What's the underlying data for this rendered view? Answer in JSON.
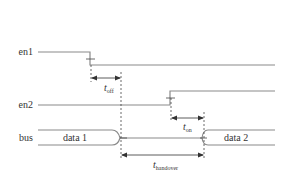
{
  "diagram": {
    "type": "timing-diagram",
    "colors": {
      "line": "#8a8a8a",
      "dim": "#333333",
      "text": "#333333",
      "background": "#ffffff"
    },
    "signals": [
      {
        "id": "en1",
        "label": "en1",
        "initial": "high",
        "transition": "falling",
        "transition_at": "t1"
      },
      {
        "id": "en2",
        "label": "en2",
        "initial": "low",
        "transition": "rising",
        "transition_at": "t2"
      },
      {
        "id": "bus",
        "label": "bus",
        "segments": [
          {
            "label": "data 1",
            "kind": "data"
          },
          {
            "label": "",
            "kind": "high-z"
          },
          {
            "label": "data 2",
            "kind": "data"
          }
        ]
      }
    ],
    "timings": [
      {
        "id": "t_off",
        "symbol": "t",
        "subscript": "off"
      },
      {
        "id": "t_on",
        "symbol": "t",
        "subscript": "on"
      },
      {
        "id": "t_handover",
        "symbol": "t",
        "subscript": "handover"
      }
    ]
  }
}
